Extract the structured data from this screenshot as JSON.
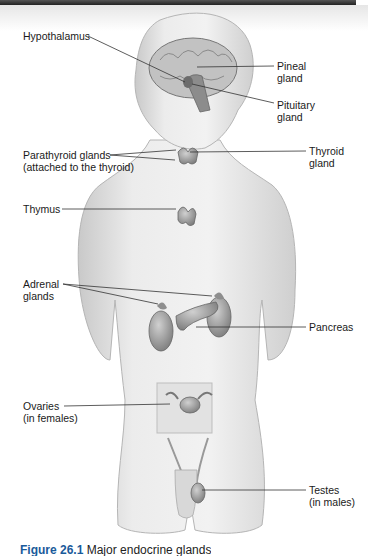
{
  "figure": {
    "caption": {
      "number": "Figure 26.1",
      "text": "Major endocrine glands",
      "note": "caption partially cut off at bottom edge"
    },
    "labels": [
      {
        "id": "hypothalamus",
        "lines": [
          "Hypothalamus"
        ]
      },
      {
        "id": "pineal",
        "lines": [
          "Pineal",
          "gland"
        ]
      },
      {
        "id": "pituitary",
        "lines": [
          "Pituitary",
          "gland"
        ]
      },
      {
        "id": "parathyroid",
        "lines": [
          "Parathyroid glands",
          "(attached to the thyroid)"
        ]
      },
      {
        "id": "thyroid",
        "lines": [
          "Thyroid",
          "gland"
        ]
      },
      {
        "id": "thymus",
        "lines": [
          "Thymus"
        ]
      },
      {
        "id": "adrenal",
        "lines": [
          "Adrenal",
          "glands"
        ]
      },
      {
        "id": "pancreas",
        "lines": [
          "Pancreas"
        ]
      },
      {
        "id": "ovaries",
        "lines": [
          "Ovaries",
          "(in females)"
        ]
      },
      {
        "id": "testes",
        "lines": [
          "Testes",
          "(in males)"
        ]
      }
    ]
  },
  "colors": {
    "body_fill": "#e8e8e8",
    "organ_fill": "#9a9a9a",
    "leader_line": "#333333",
    "caption_accent": "#1a5a9a"
  }
}
